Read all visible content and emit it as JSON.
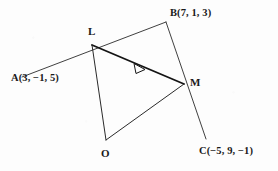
{
  "figure": {
    "background_color": "#fdfdfd",
    "ink_color": "#1a1a1a",
    "points": {
      "L": {
        "label": "L",
        "x": 92,
        "y": 45
      },
      "M": {
        "label": "M",
        "x": 184,
        "y": 84
      },
      "O": {
        "label": "O",
        "x": 106,
        "y": 140
      }
    },
    "coordinate_labels": {
      "A": "A(3, −1, 5)",
      "B": "B(7, 1, 3)",
      "C": "C(−5, 9, −1)"
    },
    "segments": [
      {
        "name": "line-A-to-B",
        "from": "A",
        "to": "B",
        "weight": "thin"
      },
      {
        "name": "line-B-to-C",
        "from": "B",
        "to": "C",
        "weight": "thin"
      },
      {
        "name": "segment-L-to-M",
        "from": "L",
        "to": "M",
        "weight": "bold"
      },
      {
        "name": "segment-L-to-O",
        "from": "L",
        "to": "O",
        "weight": "thin"
      },
      {
        "name": "segment-O-to-M",
        "from": "O",
        "to": "M",
        "weight": "thin"
      }
    ],
    "arrow_marker": {
      "name": "direction-arrowhead",
      "on_segment": "segment-L-to-M",
      "style": "open-triangle",
      "direction": "L-to-M"
    }
  }
}
